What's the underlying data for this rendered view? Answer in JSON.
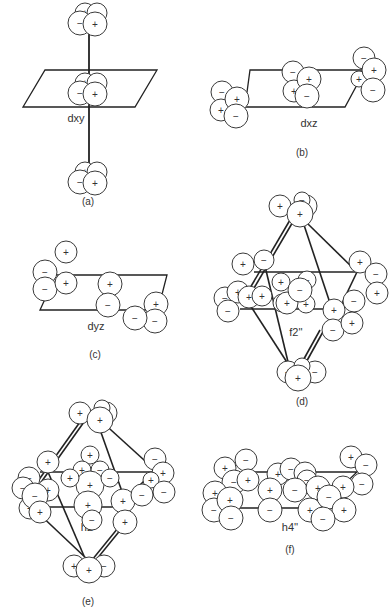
{
  "figure": {
    "panels": [
      {
        "id": "a",
        "caption": "(a)",
        "orbital_label": "dxy",
        "description": "dxy orbital lobes stacked along a vertical axis through a plane",
        "lobe_clusters": [
          {
            "position": "top",
            "signs": [
              "+",
              "−",
              "−",
              "+"
            ]
          },
          {
            "position": "center",
            "signs": [
              "+",
              "−",
              "−",
              "+"
            ]
          },
          {
            "position": "bottom",
            "signs": [
              "+",
              "−",
              "−",
              "+"
            ]
          }
        ]
      },
      {
        "id": "b",
        "caption": "(b)",
        "orbital_label": "dxz",
        "description": "dxz orbital lobes on a plane",
        "lobe_clusters": [
          {
            "position": "left",
            "signs": [
              "−",
              "+",
              "+",
              "−"
            ]
          },
          {
            "position": "center",
            "signs": [
              "−",
              "+",
              "+",
              "−"
            ]
          },
          {
            "position": "right",
            "signs": [
              "−",
              "+",
              "+",
              "−"
            ]
          }
        ]
      },
      {
        "id": "c",
        "caption": "(c)",
        "orbital_label": "dyz",
        "description": "dyz orbital lobes on a plane",
        "lobe_clusters": [
          {
            "position": "left",
            "signs": [
              "+",
              "−",
              "−",
              "+"
            ]
          },
          {
            "position": "center",
            "signs": [
              "+",
              "−",
              "+",
              "−"
            ]
          },
          {
            "position": "right",
            "signs": [
              "+",
              "−",
              "−",
              "+"
            ]
          }
        ]
      },
      {
        "id": "d",
        "caption": "(d)",
        "orbital_label": "f2''",
        "description": "f2'' orbital arrangement on an octahedral framework",
        "lobe_clusters": [
          {
            "position": "top",
            "signs": [
              "+",
              "−",
              "−",
              "+"
            ]
          },
          {
            "position": "left",
            "signs": [
              "+",
              "−",
              "−",
              "+",
              "+",
              "−"
            ]
          },
          {
            "position": "center",
            "signs": [
              "+",
              "−",
              "−",
              "+",
              "+",
              "+",
              "−"
            ]
          },
          {
            "position": "right",
            "signs": [
              "+",
              "−",
              "+",
              "+",
              "−",
              "−",
              "+"
            ]
          },
          {
            "position": "bottom",
            "signs": [
              "+",
              "−",
              "−",
              "+"
            ]
          }
        ]
      },
      {
        "id": "e",
        "caption": "(e)",
        "orbital_label": "h2''",
        "description": "h2'' orbital arrangement on an octahedral framework",
        "lobe_clusters": [
          {
            "position": "top",
            "signs": [
              "+",
              "−",
              "−",
              "+"
            ]
          },
          {
            "position": "left",
            "signs": [
              "+",
              "−",
              "+",
              "+",
              "−",
              "−",
              "+"
            ]
          },
          {
            "position": "center",
            "signs": [
              "+",
              "+",
              "−",
              "+",
              "+",
              "−",
              "+",
              "−"
            ]
          },
          {
            "position": "right",
            "signs": [
              "−",
              "+",
              "+",
              "−",
              "+",
              "−",
              "+"
            ]
          },
          {
            "position": "bottom",
            "signs": [
              "+",
              "−",
              "+"
            ]
          }
        ]
      },
      {
        "id": "f",
        "caption": "(f)",
        "orbital_label": "h4''",
        "description": "h4'' orbital arrangement on a plane",
        "lobe_clusters": [
          {
            "position": "left",
            "signs": [
              "+",
              "−",
              "−",
              "+",
              "+",
              "−",
              "+",
              "−"
            ]
          },
          {
            "position": "center",
            "signs": [
              "+",
              "−",
              "+",
              "−",
              "+",
              "−",
              "+",
              "−",
              "+"
            ]
          },
          {
            "position": "right",
            "signs": [
              "+",
              "−",
              "−",
              "+",
              "−",
              "+",
              "−",
              "+"
            ]
          }
        ]
      }
    ]
  }
}
